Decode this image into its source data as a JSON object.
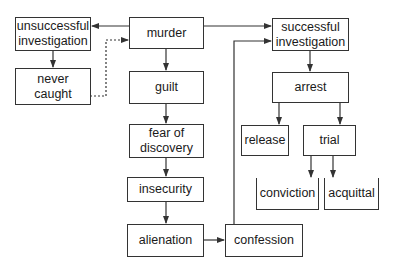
{
  "diagram": {
    "type": "flowchart",
    "colors": {
      "stroke": "#333333",
      "text": "#1a1a1a",
      "background": "#ffffff"
    },
    "nodes": {
      "murder": "murder",
      "unsuccessful_investigation": "unsuccessful investigation",
      "never_caught": "never caught",
      "guilt": "guilt",
      "fear_of_discovery": "fear of discovery",
      "insecurity": "insecurity",
      "alienation": "alienation",
      "confession": "confession",
      "successful_investigation": "successful investigation",
      "arrest": "arrest",
      "release": "release",
      "trial": "trial",
      "conviction": "conviction",
      "acquittal": "acquittal"
    },
    "edges": [
      {
        "from": "murder",
        "to": "unsuccessful investigation",
        "style": "solid"
      },
      {
        "from": "murder",
        "to": "successful investigation",
        "style": "solid"
      },
      {
        "from": "murder",
        "to": "guilt",
        "style": "solid"
      },
      {
        "from": "unsuccessful investigation",
        "to": "never caught",
        "style": "solid"
      },
      {
        "from": "never caught",
        "to": "murder",
        "style": "dotted"
      },
      {
        "from": "guilt",
        "to": "fear of discovery",
        "style": "solid"
      },
      {
        "from": "fear of discovery",
        "to": "insecurity",
        "style": "solid"
      },
      {
        "from": "insecurity",
        "to": "alienation",
        "style": "solid"
      },
      {
        "from": "alienation",
        "to": "confession",
        "style": "solid"
      },
      {
        "from": "confession",
        "to": "successful investigation",
        "style": "solid"
      },
      {
        "from": "successful investigation",
        "to": "arrest",
        "style": "solid"
      },
      {
        "from": "arrest",
        "to": "release",
        "style": "solid"
      },
      {
        "from": "arrest",
        "to": "trial",
        "style": "solid"
      },
      {
        "from": "trial",
        "to": "conviction",
        "style": "solid"
      },
      {
        "from": "trial",
        "to": "acquittal",
        "style": "solid"
      }
    ]
  }
}
